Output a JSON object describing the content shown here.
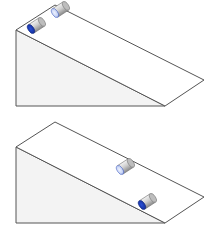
{
  "diagram": {
    "colors": {
      "outline": "#555555",
      "front_face": "#f3f3f3",
      "slope_face": "#ffffff",
      "cylinder_body": "#c8c8c8",
      "cylinder_end_dark": "#1f3fbf",
      "cylinder_end_light": "#b8c8f0"
    },
    "panels": [
      {
        "id": "top",
        "cylinders": [
          {
            "label": "dark-end cylinder",
            "end": "dark",
            "position": "top of incline, front"
          },
          {
            "label": "light-end cylinder",
            "end": "light",
            "position": "top of incline, back"
          }
        ]
      },
      {
        "id": "bottom",
        "cylinders": [
          {
            "label": "light-end cylinder",
            "end": "light",
            "position": "middle of incline, back"
          },
          {
            "label": "dark-end cylinder",
            "end": "dark",
            "position": "bottom of incline, front"
          }
        ]
      }
    ]
  }
}
